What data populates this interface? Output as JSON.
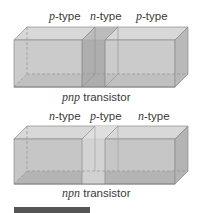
{
  "diagrams": [
    {
      "id": "pnp",
      "labels": [
        {
          "prefix": "p",
          "suffix": "-type"
        },
        {
          "prefix": "n",
          "suffix": "-type"
        },
        {
          "prefix": "p",
          "suffix": "-type"
        }
      ],
      "caption": {
        "prefix": "pnp",
        "suffix": " transistor"
      },
      "middle_shade": "dark"
    },
    {
      "id": "npn",
      "labels": [
        {
          "prefix": "n",
          "suffix": "-type"
        },
        {
          "prefix": "p",
          "suffix": "-type"
        },
        {
          "prefix": "n",
          "suffix": "-type"
        }
      ],
      "caption": {
        "prefix": "npn",
        "suffix": " transistor"
      },
      "middle_shade": "light"
    }
  ],
  "colors": {
    "box_front": "#c4c4c4",
    "box_top": "#d6d6d6",
    "box_side": "#b4b4b4",
    "box_bottom": "#a9a9a9",
    "edge": "#8a8a8a",
    "middle_dark": "#a8a8a8",
    "middle_light": "#d2d2d2",
    "text": "#3a3a3a",
    "bar": "#555555"
  }
}
